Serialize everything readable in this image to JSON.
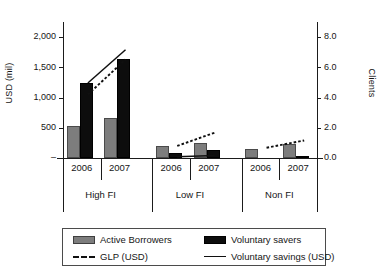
{
  "chart_data": {
    "type": "bar",
    "title": "",
    "subtitle": "",
    "categories": [
      "2006",
      "2007",
      "2006",
      "2007",
      "2006",
      "2007"
    ],
    "groups": [
      {
        "label": "High FI",
        "years": [
          "2006",
          "2007"
        ]
      },
      {
        "label": "Low FI",
        "years": [
          "2006",
          "2007"
        ]
      },
      {
        "label": "Non FI",
        "years": [
          "2006",
          "2007"
        ]
      }
    ],
    "xlabel": "",
    "ylabel": "USD (mil)",
    "y2label": "Clients",
    "ylim": [
      0,
      2250
    ],
    "y2lim": [
      0,
      9.0
    ],
    "yticks": [
      "–",
      "500",
      "1,000",
      "1,500",
      "2,000"
    ],
    "ytick_values": [
      0,
      500,
      1000,
      1500,
      2000
    ],
    "y2ticks": [
      "0.0",
      "2.0",
      "4.0",
      "6.0",
      "8.0"
    ],
    "y2tick_values": [
      0.0,
      2.0,
      4.0,
      6.0,
      8.0
    ],
    "grid": false,
    "legend_position": "bottom",
    "series": [
      {
        "name": "Active Borrowers",
        "type": "bar",
        "axis": "right",
        "color": "#7d7d7d",
        "values": [
          2.15,
          2.65,
          0.8,
          1.0,
          0.6,
          0.92
        ]
      },
      {
        "name": "Voluntary savers",
        "type": "bar",
        "axis": "right",
        "color": "#0d0d0d",
        "values": [
          4.95,
          6.52,
          0.3,
          0.52,
          0.0,
          0.06
        ]
      },
      {
        "name": "GLP (USD)",
        "type": "line",
        "style": "dashed",
        "axis": "left",
        "color": "#101010",
        "values": [
          1050,
          1630,
          200,
          420,
          170,
          290
        ]
      },
      {
        "name": "Voluntary savings (USD)",
        "type": "line",
        "style": "solid",
        "axis": "left",
        "color": "#101010",
        "values": [
          1240,
          1790,
          20,
          40,
          null,
          null
        ]
      }
    ],
    "legend": [
      {
        "label": "Active Borrowers",
        "marker": "gray-bar"
      },
      {
        "label": "Voluntary savers",
        "marker": "black-bar"
      },
      {
        "label": "GLP (USD)",
        "marker": "dashed-line"
      },
      {
        "label": "Voluntary savings (USD)",
        "marker": "solid-line"
      }
    ]
  }
}
